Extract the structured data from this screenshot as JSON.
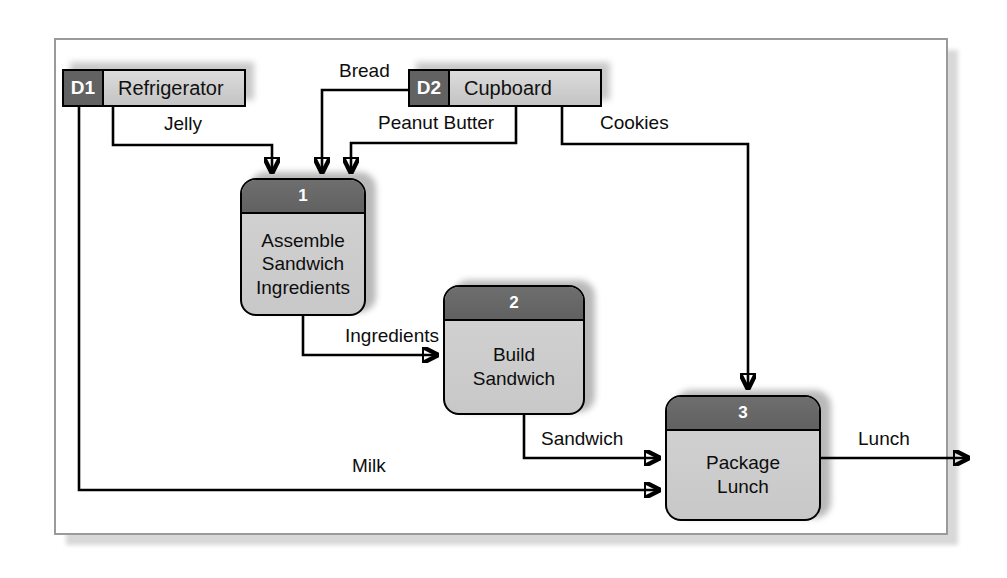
{
  "diagram": {
    "type": "data-flow-diagram",
    "notation": "Gane-Sarson",
    "data_stores": [
      {
        "id": "D1",
        "name": "Refrigerator"
      },
      {
        "id": "D2",
        "name": "Cupboard"
      }
    ],
    "processes": [
      {
        "number": "1",
        "name_lines": [
          "Assemble",
          "Sandwich",
          "Ingredients"
        ]
      },
      {
        "number": "2",
        "name_lines": [
          "Build",
          "Sandwich"
        ]
      },
      {
        "number": "3",
        "name_lines": [
          "Package",
          "Lunch"
        ]
      }
    ],
    "flows": [
      {
        "label": "Jelly",
        "from": "D1",
        "to": "1"
      },
      {
        "label": "Bread",
        "from": "D2",
        "to": "1"
      },
      {
        "label": "Peanut Butter",
        "from": "D2",
        "to": "1"
      },
      {
        "label": "Cookies",
        "from": "D2",
        "to": "3"
      },
      {
        "label": "Ingredients",
        "from": "1",
        "to": "2"
      },
      {
        "label": "Sandwich",
        "from": "2",
        "to": "3"
      },
      {
        "label": "Milk",
        "from": "D1",
        "to": "3"
      },
      {
        "label": "Lunch",
        "from": "3",
        "to": "external"
      }
    ],
    "colors": {
      "store_id_fill": "#626262",
      "store_name_fill": "#cdcdcd",
      "process_head_fill": "#616161",
      "process_body_fill": "#c8c8c8",
      "line": "#000000",
      "frame_border": "#9a9a9a"
    }
  }
}
